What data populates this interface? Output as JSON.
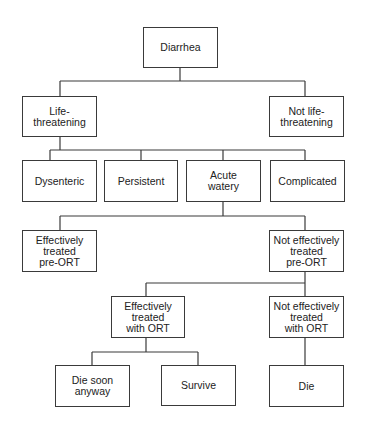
{
  "diagram": {
    "type": "decision-tree",
    "line_color": "#3a3a3a",
    "nodes": {
      "root": {
        "label": "Diarrhea"
      },
      "life_threatening": {
        "label": "Life-\nthreatening"
      },
      "not_life_threatening": {
        "label": "Not life-\nthreatening"
      },
      "dysenteric": {
        "label": "Dysenteric"
      },
      "persistent": {
        "label": "Persistent"
      },
      "acute_watery": {
        "label": "Acute\nwatery"
      },
      "complicated": {
        "label": "Complicated"
      },
      "effective_pre_ort": {
        "label": "Effectively\ntreated\npre-ORT"
      },
      "not_effective_pre_ort": {
        "label": "Not effectively\ntreated\npre-ORT"
      },
      "effective_with_ort": {
        "label": "Effectively\ntreated\nwith ORT"
      },
      "not_effective_with_ort": {
        "label": "Not effectively\ntreated\nwith ORT"
      },
      "die_soon_anyway": {
        "label": "Die soon\nanyway"
      },
      "survive": {
        "label": "Survive"
      },
      "die": {
        "label": "Die"
      }
    },
    "edges": [
      [
        "root",
        "life_threatening"
      ],
      [
        "root",
        "not_life_threatening"
      ],
      [
        "life_threatening",
        "dysenteric"
      ],
      [
        "life_threatening",
        "persistent"
      ],
      [
        "life_threatening",
        "acute_watery"
      ],
      [
        "life_threatening",
        "complicated"
      ],
      [
        "acute_watery",
        "effective_pre_ort"
      ],
      [
        "acute_watery",
        "not_effective_pre_ort"
      ],
      [
        "not_effective_pre_ort",
        "effective_with_ort"
      ],
      [
        "not_effective_pre_ort",
        "not_effective_with_ort"
      ],
      [
        "effective_with_ort",
        "die_soon_anyway"
      ],
      [
        "effective_with_ort",
        "survive"
      ],
      [
        "not_effective_with_ort",
        "die"
      ]
    ]
  }
}
